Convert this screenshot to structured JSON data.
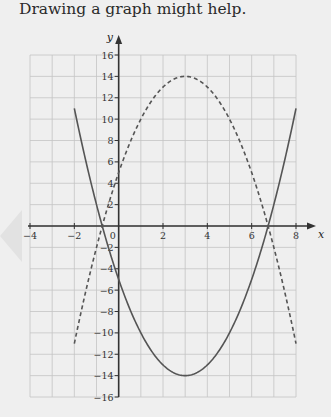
{
  "heading": "Drawing a graph might help.",
  "colors": {
    "background": "#efefef",
    "grid": "#c4c4c4",
    "axes": "#333333",
    "curve": "#555555"
  },
  "chart_data": {
    "type": "line",
    "title": "",
    "xlabel": "x",
    "ylabel": "y",
    "xlim": [
      -4,
      8
    ],
    "ylim": [
      -16,
      16
    ],
    "grid": true,
    "x_ticks": [
      -4,
      -2,
      0,
      2,
      4,
      6,
      8
    ],
    "x_tick_labels": [
      "−4",
      "−2",
      "0",
      "2",
      "4",
      "6",
      "8"
    ],
    "y_ticks": [
      -16,
      -14,
      -12,
      -10,
      -8,
      -6,
      -4,
      -2,
      2,
      4,
      6,
      8,
      10,
      12,
      14,
      16
    ],
    "y_tick_labels": [
      "−16",
      "−14",
      "−12",
      "−10",
      "−8",
      "−6",
      "−4",
      "−2",
      "2",
      "4",
      "6",
      "8",
      "10",
      "12",
      "14",
      "16"
    ],
    "series": [
      {
        "name": "solid parabola",
        "style": "solid",
        "equation": "y = x^2 - 6x - 5",
        "x": [
          -2,
          -1,
          0,
          1,
          2,
          3,
          4,
          5,
          6,
          7,
          8
        ],
        "y": [
          11,
          2,
          -5,
          -10,
          -13,
          -14,
          -13,
          -10,
          -5,
          2,
          11
        ]
      },
      {
        "name": "dashed parabola",
        "style": "dashed",
        "equation": "y = -x^2 + 6x + 5",
        "x": [
          -2,
          -1,
          0,
          1,
          2,
          3,
          4,
          5,
          6,
          7,
          8
        ],
        "y": [
          -11,
          -2,
          5,
          10,
          13,
          14,
          13,
          10,
          5,
          -2,
          -11
        ]
      }
    ]
  }
}
